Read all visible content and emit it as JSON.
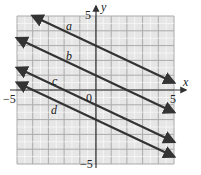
{
  "chart_data": {
    "type": "line",
    "title": "",
    "xlabel": "x",
    "ylabel": "y",
    "xlim": [
      -5,
      5
    ],
    "ylim": [
      -5,
      5
    ],
    "grid": true,
    "tick_labels": {
      "x_min": "−5",
      "x_max": "5",
      "y_max": "5",
      "y_min": "−5",
      "origin": "0"
    },
    "series": [
      {
        "name": "a",
        "x": [
          -4,
          5
        ],
        "y": [
          5,
          0.5
        ]
      },
      {
        "name": "b",
        "x": [
          -5,
          5
        ],
        "y": [
          3.5,
          -1.5
        ]
      },
      {
        "name": "c",
        "x": [
          -5,
          5
        ],
        "y": [
          1.5,
          -3.5
        ]
      },
      {
        "name": "d",
        "x": [
          -5,
          5
        ],
        "y": [
          0.5,
          -4.5
        ]
      }
    ]
  }
}
